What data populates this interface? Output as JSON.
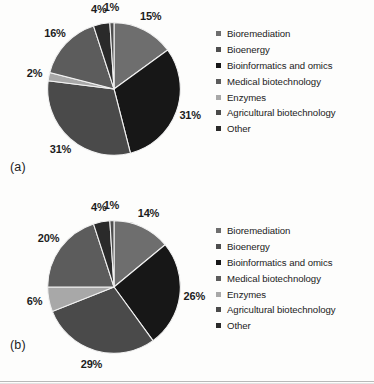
{
  "figure": {
    "panels": [
      {
        "id": "a",
        "subfig_label": "(a)",
        "labels": [
          "15%",
          "31%",
          "31%",
          "2%",
          "16%",
          "4%",
          "1%"
        ]
      },
      {
        "id": "b",
        "subfig_label": "(b)",
        "labels": [
          "14%",
          "26%",
          "29%",
          "6%",
          "20%",
          "4%",
          "1%"
        ]
      }
    ],
    "legend": {
      "items": [
        {
          "label": "Bioremediation",
          "color": "#6e6e6e"
        },
        {
          "label": "Bioenergy",
          "color": "#4e4e4e"
        },
        {
          "label": "Bioinformatics and omics",
          "color": "#171717"
        },
        {
          "label": "Medical biotechnology",
          "color": "#5c5c5c"
        },
        {
          "label": "Enzymes",
          "color": "#a8a8a8"
        },
        {
          "label": "Agricultural biotechnology",
          "color": "#4a4a4a"
        },
        {
          "label": "Other",
          "color": "#2a2a2a"
        }
      ]
    }
  },
  "chart_data": [
    {
      "type": "pie",
      "title": "(a)",
      "categories": [
        "Bioremediation",
        "Bioenergy",
        "Bioinformatics and omics",
        "Medical biotechnology",
        "Enzymes",
        "Agricultural biotechnology",
        "Other"
      ],
      "values": [
        15,
        1,
        31,
        16,
        2,
        31,
        4
      ],
      "data_labels": [
        "15%",
        "1%",
        "31%",
        "16%",
        "2%",
        "31%",
        "4%"
      ],
      "colors": [
        "#6e6e6e",
        "#4e4e4e",
        "#171717",
        "#5c5c5c",
        "#a8a8a8",
        "#4a4a4a",
        "#2a2a2a"
      ],
      "unit": "percent",
      "legend_position": "right",
      "start_angle": 0,
      "direction": "clockwise",
      "slice_order": [
        "Bioremediation",
        "Bioinformatics and omics",
        "Agricultural biotechnology",
        "Enzymes",
        "Medical biotechnology",
        "Other",
        "Bioenergy"
      ]
    },
    {
      "type": "pie",
      "title": "(b)",
      "categories": [
        "Bioremediation",
        "Bioenergy",
        "Bioinformatics and omics",
        "Medical biotechnology",
        "Enzymes",
        "Agricultural biotechnology",
        "Other"
      ],
      "values": [
        14,
        1,
        26,
        20,
        6,
        29,
        4
      ],
      "data_labels": [
        "14%",
        "1%",
        "26%",
        "20%",
        "6%",
        "29%",
        "4%"
      ],
      "colors": [
        "#6e6e6e",
        "#4e4e4e",
        "#171717",
        "#5c5c5c",
        "#a8a8a8",
        "#4a4a4a",
        "#2a2a2a"
      ],
      "unit": "percent",
      "legend_position": "right",
      "start_angle": 0,
      "direction": "clockwise",
      "slice_order": [
        "Bioremediation",
        "Bioinformatics and omics",
        "Agricultural biotechnology",
        "Enzymes",
        "Medical biotechnology",
        "Other",
        "Bioenergy"
      ]
    }
  ]
}
